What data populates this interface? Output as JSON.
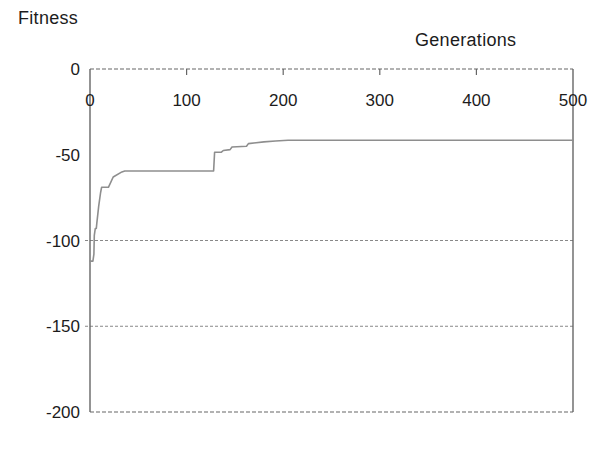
{
  "chart_data": {
    "type": "line",
    "title": "",
    "ylabel": "Fitness",
    "xlabel": "Generations",
    "xlim": [
      0,
      500
    ],
    "ylim": [
      -200,
      0
    ],
    "x_ticks": [
      0,
      100,
      200,
      300,
      400,
      500
    ],
    "y_ticks": [
      0,
      -50,
      -100,
      -150,
      -200
    ],
    "gridlines_y": [
      -100,
      -150
    ],
    "grid_style": "dashed",
    "legend_position": "none",
    "axis_color": "#666666",
    "grid_color": "#888888",
    "line_color": "#8e8e8e",
    "text_color": "#1c1c1c",
    "series": [
      {
        "name": "best fitness",
        "points": [
          [
            0,
            -112
          ],
          [
            3,
            -112
          ],
          [
            4,
            -108
          ],
          [
            4.5,
            -97
          ],
          [
            5,
            -95
          ],
          [
            5.5,
            -93
          ],
          [
            6.5,
            -93
          ],
          [
            7,
            -90
          ],
          [
            9,
            -80
          ],
          [
            11,
            -72
          ],
          [
            12,
            -69
          ],
          [
            19,
            -69
          ],
          [
            24,
            -63
          ],
          [
            33,
            -60
          ],
          [
            36,
            -59.5
          ],
          [
            128,
            -59.5
          ],
          [
            129,
            -48.5
          ],
          [
            136,
            -48.5
          ],
          [
            138,
            -47.5
          ],
          [
            145,
            -47
          ],
          [
            147,
            -45.5
          ],
          [
            162,
            -45
          ],
          [
            164,
            -43.5
          ],
          [
            180,
            -42.5
          ],
          [
            192,
            -42
          ],
          [
            205,
            -41.5
          ],
          [
            215,
            -41.5
          ],
          [
            500,
            -41.5
          ]
        ]
      }
    ]
  }
}
